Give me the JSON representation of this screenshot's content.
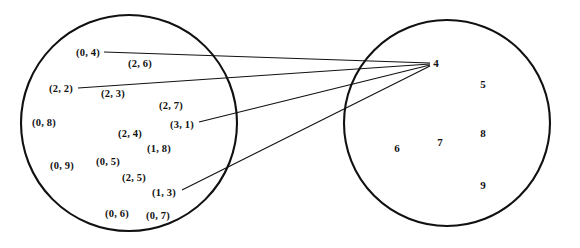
{
  "diagram": {
    "type": "function-mapping-venn",
    "title": "",
    "stroke_color": "#111111",
    "fill_color": "#ffffff",
    "domain_set": {
      "name": "domain-circle",
      "cx": 129,
      "cy": 123,
      "r": 108,
      "elements": [
        {
          "label": "(0, 4)",
          "x": 88,
          "y": 52
        },
        {
          "label": "(2, 6)",
          "x": 140,
          "y": 63
        },
        {
          "label": "(2, 2)",
          "x": 61,
          "y": 88
        },
        {
          "label": "(2, 3)",
          "x": 113,
          "y": 93
        },
        {
          "label": "(2, 7)",
          "x": 171,
          "y": 105
        },
        {
          "label": "(0, 8)",
          "x": 44,
          "y": 122
        },
        {
          "label": "(2, 4)",
          "x": 130,
          "y": 133
        },
        {
          "label": "(3, 1)",
          "x": 182,
          "y": 124
        },
        {
          "label": "(1, 8)",
          "x": 159,
          "y": 148
        },
        {
          "label": "(0, 9)",
          "x": 62,
          "y": 165
        },
        {
          "label": "(0, 5)",
          "x": 108,
          "y": 161
        },
        {
          "label": "(2, 5)",
          "x": 134,
          "y": 177
        },
        {
          "label": "(1, 3)",
          "x": 164,
          "y": 192
        },
        {
          "label": "(0, 6)",
          "x": 117,
          "y": 213
        },
        {
          "label": "(0, 7)",
          "x": 158,
          "y": 215
        }
      ]
    },
    "codomain_set": {
      "name": "codomain-circle",
      "cx": 447,
      "cy": 123,
      "r": 103,
      "elements": [
        {
          "label": "4",
          "x": 436,
          "y": 63
        },
        {
          "label": "5",
          "x": 483,
          "y": 84
        },
        {
          "label": "6",
          "x": 397,
          "y": 148
        },
        {
          "label": "7",
          "x": 440,
          "y": 142
        },
        {
          "label": "8",
          "x": 483,
          "y": 133
        },
        {
          "label": "9",
          "x": 483,
          "y": 185
        }
      ]
    },
    "mappings": [
      {
        "from": "(0, 4)",
        "to": "4",
        "x1": 104,
        "y1": 52,
        "x2": 430,
        "y2": 63
      },
      {
        "from": "(2, 2)",
        "to": "4",
        "x1": 78,
        "y1": 88,
        "x2": 430,
        "y2": 64
      },
      {
        "from": "(3, 1)",
        "to": "4",
        "x1": 199,
        "y1": 122,
        "x2": 430,
        "y2": 65
      },
      {
        "from": "(1, 3)",
        "to": "4",
        "x1": 182,
        "y1": 190,
        "x2": 430,
        "y2": 66
      }
    ]
  }
}
